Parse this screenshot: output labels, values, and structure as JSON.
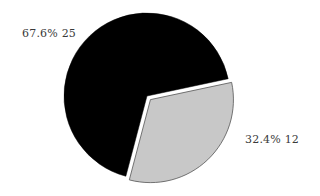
{
  "chart_data": {
    "type": "pie",
    "title": "",
    "categories": [
      "Slice A",
      "Slice B"
    ],
    "values": [
      25,
      12
    ],
    "percentages": [
      67.6,
      32.4
    ],
    "labels": [
      "67.6% 25",
      "32.4%  12"
    ],
    "colors": [
      "#000000",
      "#c8c8c8"
    ],
    "exploded": [
      false,
      true
    ],
    "legend": "none",
    "start_angle_deg": -12
  }
}
